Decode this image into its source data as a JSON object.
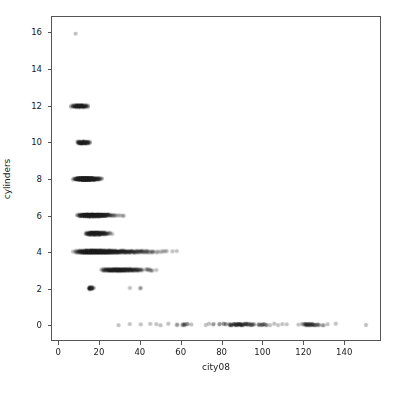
{
  "chart_data": {
    "type": "scatter",
    "title": "",
    "xlabel": "city08",
    "ylabel": "cylinders",
    "xlim": [
      -3.5,
      158
    ],
    "ylim": [
      -0.85,
      16.9
    ],
    "xticks": [
      0,
      20,
      40,
      60,
      80,
      100,
      120,
      140
    ],
    "xtick_labels": [
      "0",
      "20",
      "40",
      "60",
      "80",
      "100",
      "120",
      "140"
    ],
    "yticks": [
      0,
      2,
      4,
      6,
      8,
      10,
      12,
      14,
      16
    ],
    "ytick_labels": [
      "0",
      "2",
      "4",
      "6",
      "8",
      "10",
      "12",
      "14",
      "16"
    ],
    "grid": false,
    "legend": null,
    "marker": {
      "shape": "circle",
      "size_px": 4.2,
      "color": "#1f1f1f",
      "alpha": 0.28,
      "edge_color": "none"
    },
    "background_color": "#ffffff",
    "spine_color": "#555555",
    "series": [
      {
        "name": "vehicles",
        "points_by_cylinder": [
          {
            "y": 16,
            "x_range": [
              8,
              8
            ],
            "x_values": [
              8
            ],
            "weights": [
              1
            ],
            "note": "single 16-cylinder vehicle"
          },
          {
            "y": 12,
            "x_range": [
              6,
              14
            ],
            "x_values": [
              6,
              7,
              8,
              9,
              10,
              11,
              12,
              13,
              14
            ],
            "weights": [
              2,
              5,
              12,
              20,
              26,
              22,
              14,
              7,
              3
            ],
            "note": "dense short band"
          },
          {
            "y": 10,
            "x_range": [
              9,
              15
            ],
            "x_values": [
              9,
              10,
              11,
              12,
              13,
              14,
              15
            ],
            "weights": [
              3,
              10,
              18,
              22,
              16,
              8,
              3
            ],
            "note": "dense short band"
          },
          {
            "y": 8,
            "x_range": [
              7,
              21
            ],
            "x_values": [
              7,
              8,
              9,
              10,
              11,
              12,
              13,
              14,
              15,
              16,
              17,
              18,
              19,
              20,
              21
            ],
            "weights": [
              2,
              5,
              12,
              24,
              38,
              48,
              52,
              48,
              40,
              30,
              20,
              12,
              7,
              4,
              2
            ],
            "note": "long dense band"
          },
          {
            "y": 6,
            "x_range": [
              9,
              32
            ],
            "x_values": [
              9,
              10,
              11,
              12,
              13,
              14,
              15,
              16,
              17,
              18,
              19,
              20,
              21,
              22,
              23,
              24,
              25,
              26,
              27,
              28,
              29,
              30,
              31,
              32
            ],
            "weights": [
              2,
              5,
              10,
              20,
              32,
              42,
              50,
              52,
              48,
              40,
              32,
              24,
              18,
              13,
              9,
              6,
              4,
              3,
              2,
              1,
              1,
              1,
              1,
              1
            ],
            "note": "long band tapering to the right"
          },
          {
            "y": 5,
            "x_range": [
              13,
              26
            ],
            "x_values": [
              13,
              14,
              15,
              16,
              17,
              18,
              19,
              20,
              21,
              22,
              23,
              24,
              25,
              26
            ],
            "weights": [
              2,
              6,
              14,
              22,
              28,
              30,
              26,
              20,
              14,
              9,
              5,
              3,
              2,
              1
            ],
            "note": "medium band"
          },
          {
            "y": 4,
            "x_range": [
              7,
              58
            ],
            "x_values": [
              7,
              8,
              9,
              10,
              11,
              12,
              13,
              14,
              15,
              16,
              17,
              18,
              19,
              20,
              21,
              22,
              23,
              24,
              25,
              26,
              27,
              28,
              29,
              30,
              31,
              32,
              33,
              34,
              35,
              36,
              37,
              38,
              39,
              40,
              41,
              42,
              43,
              44,
              45,
              46,
              47,
              48,
              49,
              50,
              51,
              52,
              53,
              54,
              55,
              56,
              57,
              58
            ],
            "weights": [
              1,
              2,
              4,
              8,
              14,
              22,
              34,
              46,
              56,
              62,
              64,
              62,
              58,
              52,
              46,
              40,
              34,
              29,
              24,
              20,
              17,
              14,
              12,
              10,
              9,
              8,
              7,
              6,
              6,
              5,
              5,
              4,
              4,
              4,
              3,
              3,
              3,
              2,
              2,
              2,
              1,
              1,
              1,
              1,
              1,
              1,
              1,
              0,
              0,
              1,
              0,
              1
            ],
            "note": "densest band; solid to about 45 then sparse points out to 58"
          },
          {
            "y": 3,
            "x_range": [
              21,
              48
            ],
            "x_values": [
              21,
              22,
              23,
              24,
              25,
              26,
              27,
              28,
              29,
              30,
              31,
              32,
              33,
              34,
              35,
              36,
              37,
              38,
              39,
              40,
              41,
              43,
              44,
              45,
              46,
              48
            ],
            "weights": [
              2,
              4,
              6,
              8,
              12,
              14,
              16,
              18,
              18,
              16,
              14,
              12,
              10,
              9,
              8,
              7,
              6,
              5,
              4,
              3,
              2,
              2,
              2,
              2,
              1,
              1
            ],
            "note": "band from low 20s to high 40s"
          },
          {
            "y": 2,
            "x_range": [
              15,
              40
            ],
            "x_values": [
              15,
              16,
              17,
              35,
              40
            ],
            "weights": [
              14,
              10,
              2,
              1,
              2
            ],
            "note": "dark tight cluster near 15-16 plus isolated points at 35 and 40"
          },
          {
            "y": 0,
            "x_range": [
              29,
              151
            ],
            "x_values": [
              29,
              35,
              40,
              45,
              48,
              50,
              54,
              58,
              61,
              62,
              63,
              65,
              72,
              74,
              76,
              79,
              81,
              82,
              84,
              85,
              86,
              87,
              88,
              89,
              90,
              91,
              92,
              93,
              94,
              95,
              96,
              98,
              99,
              100,
              101,
              102,
              104,
              106,
              108,
              110,
              112,
              118,
              120,
              121,
              122,
              123,
              124,
              125,
              126,
              127,
              128,
              130,
              132,
              136,
              151
            ],
            "weights": [
              1,
              1,
              1,
              1,
              1,
              1,
              1,
              2,
              3,
              3,
              2,
              1,
              1,
              1,
              2,
              2,
              2,
              2,
              3,
              4,
              4,
              5,
              6,
              6,
              5,
              4,
              4,
              3,
              3,
              3,
              2,
              2,
              2,
              3,
              2,
              2,
              1,
              1,
              1,
              1,
              1,
              1,
              2,
              4,
              5,
              5,
              4,
              4,
              3,
              2,
              2,
              2,
              1,
              1,
              1
            ],
            "note": "electric vehicles spread across high mpg-equivalent values with clusters near 85-95 and 120-130"
          }
        ]
      }
    ]
  }
}
